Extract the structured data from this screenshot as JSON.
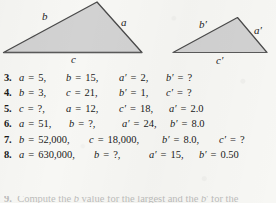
{
  "figure": {
    "caption_note": "Two similar triangles with labelled sides",
    "large_triangle": {
      "name": "large-triangle",
      "labels": [
        {
          "id": "b",
          "text": "b",
          "prime": false
        },
        {
          "id": "a",
          "text": "a",
          "prime": false
        },
        {
          "id": "c",
          "text": "c",
          "prime": false
        }
      ]
    },
    "small_triangle": {
      "name": "small-triangle",
      "labels": [
        {
          "id": "b-prime",
          "text": "b",
          "prime": true
        },
        {
          "id": "a-prime",
          "text": "a",
          "prime": true
        },
        {
          "id": "c-prime",
          "text": "c",
          "prime": true
        }
      ]
    },
    "fill_color": "#d2d2d2",
    "stroke_color": "#4a4a4a",
    "label_color": "#242424"
  },
  "colors": {
    "page_background": "#f7f7f4",
    "text": "#1a1a1a",
    "figure_fill": "#d2d2d2",
    "figure_stroke": "#4a4a4a"
  },
  "problems": [
    {
      "number": "3.",
      "terms": [
        {
          "var": "a",
          "prime": false,
          "value": "5,"
        },
        {
          "var": "b",
          "prime": false,
          "value": "15,"
        },
        {
          "var": "a",
          "prime": true,
          "value": "2,"
        },
        {
          "var": "b",
          "prime": true,
          "value": "?"
        }
      ]
    },
    {
      "number": "4.",
      "terms": [
        {
          "var": "b",
          "prime": false,
          "value": "3,"
        },
        {
          "var": "c",
          "prime": false,
          "value": "21,"
        },
        {
          "var": "b",
          "prime": true,
          "value": "1,"
        },
        {
          "var": "c",
          "prime": true,
          "value": "?"
        }
      ]
    },
    {
      "number": "5.",
      "terms": [
        {
          "var": "c",
          "prime": false,
          "value": "?,"
        },
        {
          "var": "a",
          "prime": false,
          "value": "12,"
        },
        {
          "var": "c",
          "prime": true,
          "value": "18,"
        },
        {
          "var": "a",
          "prime": true,
          "value": "2.0"
        }
      ]
    },
    {
      "number": "6.",
      "terms": [
        {
          "var": "a",
          "prime": false,
          "value": "51,"
        },
        {
          "var": "b",
          "prime": false,
          "value": "?,"
        },
        {
          "var": "a",
          "prime": true,
          "value": "24,"
        },
        {
          "var": "b",
          "prime": true,
          "value": "8.0"
        }
      ]
    },
    {
      "number": "7.",
      "terms": [
        {
          "var": "b",
          "prime": false,
          "value": "52,000,"
        },
        {
          "var": "c",
          "prime": false,
          "value": "18,000,"
        },
        {
          "var": "b",
          "prime": true,
          "value": "8.0,"
        },
        {
          "var": "c",
          "prime": true,
          "value": "?"
        }
      ]
    },
    {
      "number": "8.",
      "terms": [
        {
          "var": "a",
          "prime": false,
          "value": "630,000,"
        },
        {
          "var": "b",
          "prime": false,
          "value": "?,"
        },
        {
          "var": "a",
          "prime": true,
          "value": "15,"
        },
        {
          "var": "b",
          "prime": true,
          "value": "0.50"
        }
      ]
    }
  ],
  "equals_sign": "=",
  "prime_mark": "′",
  "clipped_line": {
    "number": "9.",
    "text": "partially visible cut-off line"
  }
}
